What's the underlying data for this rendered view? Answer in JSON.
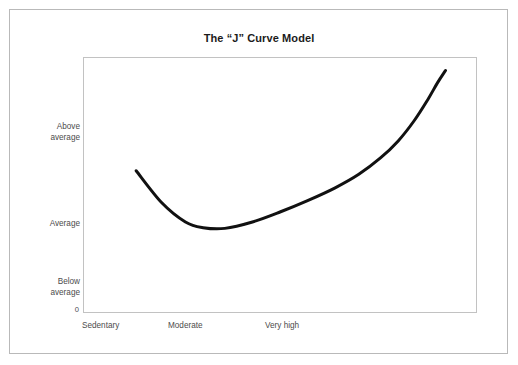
{
  "figure": {
    "title": "The “J” Curve Model",
    "background_color": "#ffffff",
    "outer_border_color": "#b9b9b9",
    "plot_border_color": "#c2c2c2",
    "curve_color": "#111111",
    "label_color": "#4c4c4c",
    "title_color": "#1b1b1b"
  },
  "axes": {
    "y": {
      "tick_labels": [
        "Above\naverage",
        "Average",
        "Below\naverage"
      ],
      "origin_label": "0"
    },
    "x": {
      "tick_labels": [
        "Sedentary",
        "Moderate",
        "Very high"
      ]
    }
  },
  "chart_data": {
    "type": "line",
    "title": "The “J” Curve Model",
    "xlabel": "",
    "ylabel": "",
    "grid": false,
    "legend": null,
    "x_tick_labels": [
      "Sedentary",
      "Moderate",
      "Very high"
    ],
    "x_tick_values": [
      0.0,
      0.4,
      0.85
    ],
    "y_tick_labels": [
      "Below average",
      "Average",
      "Above average"
    ],
    "y_tick_values": [
      1.0,
      2.0,
      3.0
    ],
    "y_origin_label": "0",
    "xlim": [
      0,
      1
    ],
    "ylim": [
      0,
      3.6
    ],
    "series": [
      {
        "name": "Risk of illness / injury",
        "color": "#111111",
        "linewidth": 3,
        "x": [
          0.135,
          0.2,
          0.26,
          0.305,
          0.36,
          0.43,
          0.5,
          0.57,
          0.64,
          0.7,
          0.755,
          0.8,
          0.84,
          0.875,
          0.9,
          0.92
        ],
        "y": [
          2.0,
          1.55,
          1.28,
          1.2,
          1.19,
          1.28,
          1.42,
          1.58,
          1.76,
          1.95,
          2.18,
          2.42,
          2.7,
          3.0,
          3.24,
          3.41
        ]
      }
    ],
    "annotations": []
  }
}
